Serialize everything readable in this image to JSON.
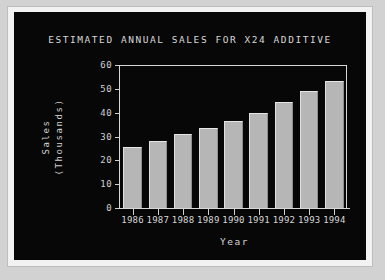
{
  "screen": {
    "background_color": "#070707",
    "foreground_color": "#d6d6d6",
    "bezel_color": "#d2d2d2"
  },
  "chart_data": {
    "type": "bar",
    "title": "ESTIMATED ANNUAL SALES FOR X24 ADDITIVE",
    "xlabel": "Year",
    "ylabel": "Sales\n(Thousands)",
    "ylabel_line1": "Sales",
    "ylabel_line2": "(Thousands)",
    "categories": [
      "1986",
      "1987",
      "1988",
      "1989",
      "1990",
      "1991",
      "1992",
      "1993",
      "1994"
    ],
    "values": [
      25.5,
      28,
      31,
      33.5,
      36.5,
      40,
      44.5,
      49,
      53.5
    ],
    "yticks": [
      0,
      10,
      20,
      30,
      40,
      50,
      60
    ],
    "ytick_labels": [
      "0",
      "10",
      "20",
      "30",
      "40",
      "50",
      "60"
    ],
    "ylim": [
      0,
      60
    ],
    "grid": false,
    "legend": null,
    "bar_color": "#b6b6b6",
    "axis_color": "#d6d6d6"
  }
}
